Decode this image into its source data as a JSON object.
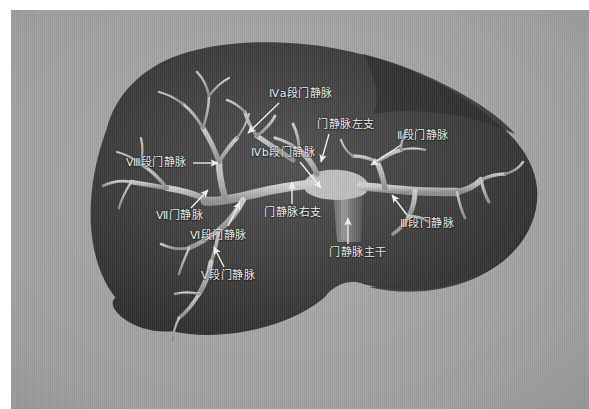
{
  "figure": {
    "kind": "anatomical-illustration",
    "background_color": "#a8a8a8",
    "liver_color": "#3a3a3a",
    "vessel_color": "#b5b5b5",
    "label_color": "#f2f2f2",
    "arrow_color": "#f5f5f5"
  },
  "labels": [
    {
      "id": "iva",
      "text": "Ⅳa段门静脉",
      "x": 258,
      "y": 77,
      "arrow": {
        "x1": 268,
        "y1": 93,
        "x2": 237,
        "y2": 123
      }
    },
    {
      "id": "left-branch",
      "text": "门静脉左支",
      "x": 306,
      "y": 108,
      "arrow": {
        "x1": 318,
        "y1": 124,
        "x2": 310,
        "y2": 152
      }
    },
    {
      "id": "seg2",
      "text": "Ⅱ段门静脉",
      "x": 386,
      "y": 119,
      "arrow": {
        "x1": 390,
        "y1": 135,
        "x2": 360,
        "y2": 155
      }
    },
    {
      "id": "ivb",
      "text": "Ⅳb段门静脉",
      "x": 240,
      "y": 136,
      "arrow": {
        "x1": 289,
        "y1": 152,
        "x2": 310,
        "y2": 178
      }
    },
    {
      "id": "seg8",
      "text": "Ⅷ段门静脉",
      "x": 115,
      "y": 146,
      "arrow": {
        "x1": 182,
        "y1": 153,
        "x2": 207,
        "y2": 153
      }
    },
    {
      "id": "seg7",
      "text": "Ⅶ门静脉",
      "x": 145,
      "y": 199,
      "arrow": {
        "x1": 180,
        "y1": 198,
        "x2": 197,
        "y2": 180
      }
    },
    {
      "id": "right-branch",
      "text": "门静脉右支",
      "x": 253,
      "y": 196,
      "arrow": {
        "x1": 281,
        "y1": 194,
        "x2": 281,
        "y2": 172
      }
    },
    {
      "id": "seg6",
      "text": "Ⅵ段门静脉",
      "x": 179,
      "y": 219,
      "arrow": {
        "x1": 217,
        "y1": 216,
        "x2": 229,
        "y2": 192
      }
    },
    {
      "id": "main-trunk",
      "text": "门静脉主干",
      "x": 318,
      "y": 236,
      "arrow": {
        "x1": 337,
        "y1": 234,
        "x2": 337,
        "y2": 208
      }
    },
    {
      "id": "seg3",
      "text": "Ⅲ段门静脉",
      "x": 389,
      "y": 207,
      "arrow": {
        "x1": 396,
        "y1": 205,
        "x2": 381,
        "y2": 185
      }
    },
    {
      "id": "seg5",
      "text": "Ⅴ段门静脉",
      "x": 190,
      "y": 259,
      "arrow": {
        "x1": 213,
        "y1": 257,
        "x2": 203,
        "y2": 237
      }
    }
  ]
}
